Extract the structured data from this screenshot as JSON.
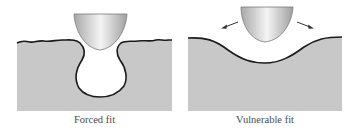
{
  "panels": [
    {
      "id": "forced",
      "caption": "Forced fit",
      "description": "Pick-shaped object pushed into a narrow-necked round cavity in a textured surface"
    },
    {
      "id": "vulnerable",
      "caption": "Vulnerable fit",
      "description": "Pick-shaped object resting above a shallow wide depression; arrows indicate it can slide out sideways"
    }
  ],
  "colors": {
    "substrate_fill": "#c8c8c8",
    "outline": "#1a1a1a",
    "object_light": "#f2f2f2",
    "object_dark": "#a8a8a8",
    "arrow": "#333333",
    "caption_text": "#4a4a4a"
  },
  "icons": {
    "left_arrow": "arrow-up-left",
    "right_arrow": "arrow-up-right"
  }
}
